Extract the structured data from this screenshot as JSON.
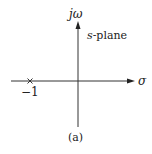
{
  "diagram": {
    "type": "s-plane pole plot",
    "plane_label": "s-plane",
    "vertical_axis_label": "jω",
    "horizontal_axis_label": "σ",
    "caption": "(a)",
    "poles": [
      {
        "position": -1,
        "label": "−1",
        "marker": "x-mark"
      }
    ],
    "colors": {
      "axis": "#333333",
      "text": "#222222",
      "background": "#ffffff"
    }
  }
}
